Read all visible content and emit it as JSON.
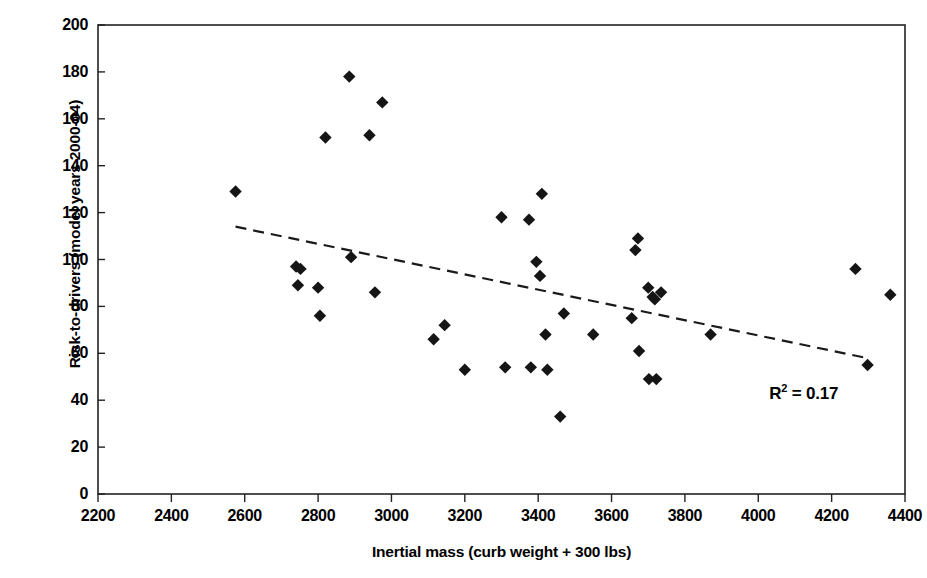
{
  "chart_data": {
    "type": "scatter",
    "title": "",
    "xlabel": "Inertial mass (curb weight + 300 lbs)",
    "ylabel": "Risk-to-drivers (model years 2000-04)",
    "xlim": [
      2200,
      4400
    ],
    "ylim": [
      0,
      200
    ],
    "xticks": [
      2200,
      2400,
      2600,
      2800,
      3000,
      3200,
      3400,
      3600,
      3800,
      4000,
      4200,
      4400
    ],
    "yticks": [
      0,
      20,
      40,
      60,
      80,
      100,
      120,
      140,
      160,
      180,
      200
    ],
    "grid": false,
    "legend": null,
    "marker": "diamond",
    "marker_color": "#151515",
    "annotations": [
      {
        "text": "R² = 0.17",
        "text_main": "R",
        "text_sup": "2",
        "text_rest": " = 0.17",
        "x": 4030,
        "y": 43
      }
    ],
    "trendline": {
      "style": "dashed",
      "color": "#1a1a1a",
      "x_start": 2575,
      "y_start": 114,
      "x_end": 4295,
      "y_end": 58
    },
    "points": [
      {
        "x": 2575,
        "y": 129
      },
      {
        "x": 2740,
        "y": 97
      },
      {
        "x": 2752,
        "y": 96
      },
      {
        "x": 2745,
        "y": 89
      },
      {
        "x": 2800,
        "y": 88
      },
      {
        "x": 2805,
        "y": 76
      },
      {
        "x": 2820,
        "y": 152
      },
      {
        "x": 2885,
        "y": 178
      },
      {
        "x": 2890,
        "y": 101
      },
      {
        "x": 2940,
        "y": 153
      },
      {
        "x": 2955,
        "y": 86
      },
      {
        "x": 2975,
        "y": 167
      },
      {
        "x": 3115,
        "y": 66
      },
      {
        "x": 3145,
        "y": 72
      },
      {
        "x": 3200,
        "y": 53
      },
      {
        "x": 3300,
        "y": 118
      },
      {
        "x": 3310,
        "y": 54
      },
      {
        "x": 3375,
        "y": 117
      },
      {
        "x": 3380,
        "y": 54
      },
      {
        "x": 3395,
        "y": 99
      },
      {
        "x": 3405,
        "y": 93
      },
      {
        "x": 3410,
        "y": 128
      },
      {
        "x": 3420,
        "y": 68
      },
      {
        "x": 3425,
        "y": 53
      },
      {
        "x": 3460,
        "y": 33
      },
      {
        "x": 3470,
        "y": 77
      },
      {
        "x": 3550,
        "y": 68
      },
      {
        "x": 3655,
        "y": 75
      },
      {
        "x": 3665,
        "y": 104
      },
      {
        "x": 3672,
        "y": 109
      },
      {
        "x": 3675,
        "y": 61
      },
      {
        "x": 3700,
        "y": 88
      },
      {
        "x": 3702,
        "y": 49
      },
      {
        "x": 3712,
        "y": 84
      },
      {
        "x": 3718,
        "y": 83
      },
      {
        "x": 3722,
        "y": 49
      },
      {
        "x": 3735,
        "y": 86
      },
      {
        "x": 3870,
        "y": 68
      },
      {
        "x": 4265,
        "y": 96
      },
      {
        "x": 4298,
        "y": 55
      },
      {
        "x": 4360,
        "y": 85
      }
    ]
  },
  "axes": {
    "plot_left_px": 98,
    "plot_right_px": 905,
    "plot_top_px": 25,
    "plot_bottom_px": 494
  }
}
